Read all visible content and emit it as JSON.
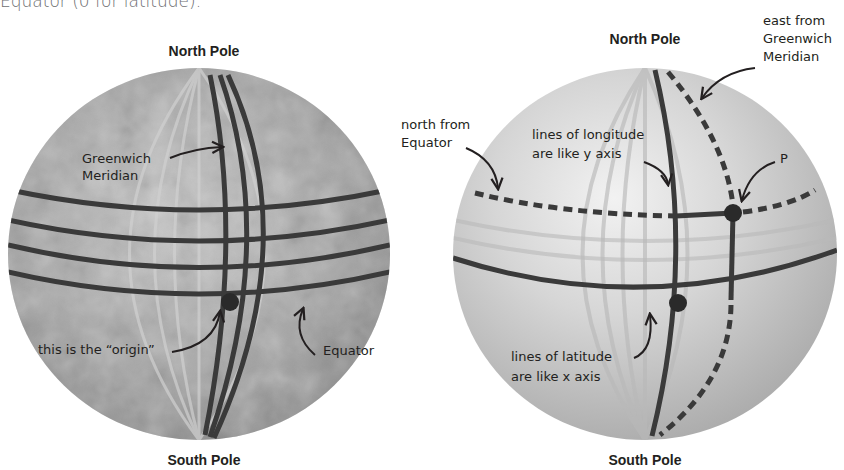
{
  "intro_text": "Equator (0 for latitude).",
  "left_globe": {
    "north_label": "North Pole",
    "south_label": "South Pole",
    "greenwich_label_line1": "Greenwich",
    "greenwich_label_line2": "Meridian",
    "origin_label": "this is the “origin”",
    "equator_label": "Equator"
  },
  "right_globe": {
    "north_label": "North Pole",
    "south_label": "South Pole",
    "east_label_line1": "east from",
    "east_label_line2": "Greenwich",
    "east_label_line3": "Meridian",
    "north_from_line1": "north from",
    "north_from_line2": "Equator",
    "longitude_line1": "lines of longitude",
    "longitude_line2": "are like y axis",
    "point_label": "P",
    "latitude_line1": "lines of latitude",
    "latitude_line2": "are like x axis"
  },
  "colors": {
    "line_dark": "#3a3a3a",
    "globe_left": "#9a9a9a",
    "globe_right": "#c4c4c4"
  }
}
